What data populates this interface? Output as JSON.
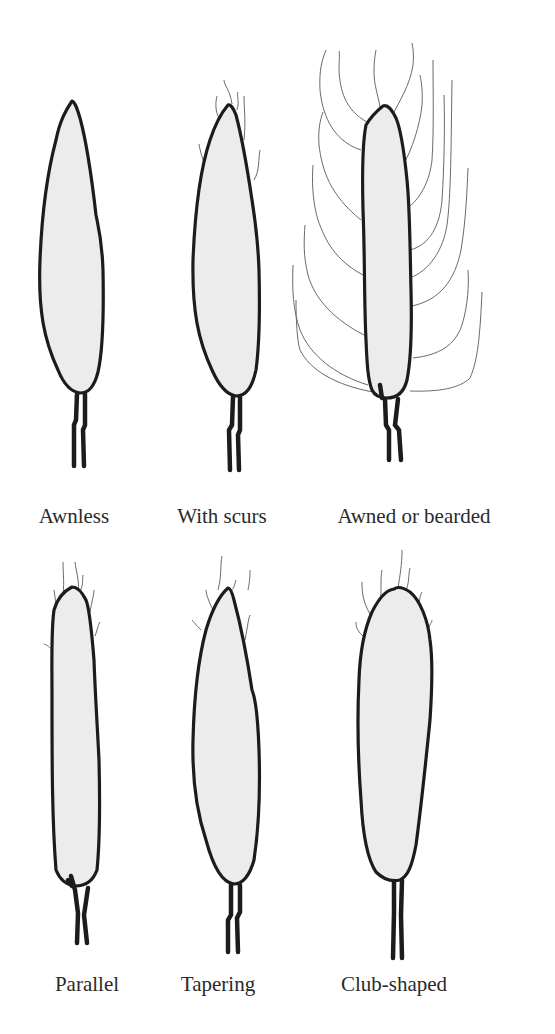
{
  "figure": {
    "fill_color": "#ececec",
    "outline_color": "#1c1c1c",
    "awn_color": "#6a6a6a",
    "background": "#ffffff"
  },
  "rows": [
    {
      "items": [
        {
          "label": "Awnless",
          "awns": "none",
          "shape": "lanceolate"
        },
        {
          "label": "With scurs",
          "awns": "short",
          "shape": "lanceolate"
        },
        {
          "label": "Awned or bearded",
          "awns": "long",
          "shape": "parallel"
        }
      ]
    },
    {
      "items": [
        {
          "label": "Parallel",
          "awns": "short",
          "shape": "parallel"
        },
        {
          "label": "Tapering",
          "awns": "short",
          "shape": "tapering"
        },
        {
          "label": "Club-shaped",
          "awns": "short",
          "shape": "club"
        }
      ]
    }
  ]
}
